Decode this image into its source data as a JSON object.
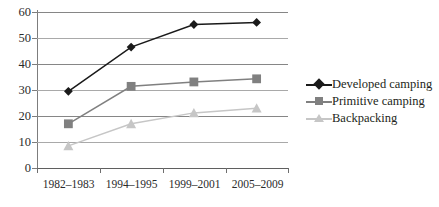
{
  "chart_data": {
    "type": "line",
    "title": "",
    "xlabel": "",
    "ylabel": "",
    "categories": [
      "1982–1983",
      "1994–1995",
      "1999–2001",
      "2005–2009"
    ],
    "series": [
      {
        "name": "Developed camping",
        "marker": "diamond",
        "color": "#1a1a1a",
        "values": [
          29.5,
          46.5,
          55.2,
          56.0
        ]
      },
      {
        "name": "Primitive camping",
        "marker": "square",
        "color": "#808080",
        "values": [
          17.0,
          31.4,
          33.1,
          34.3
        ]
      },
      {
        "name": "Backpacking",
        "marker": "triangle",
        "color": "#c6c6c6",
        "values": [
          8.5,
          17.0,
          21.2,
          23.0
        ]
      }
    ],
    "ylim": [
      0,
      60
    ],
    "yticks": [
      0,
      10,
      20,
      30,
      40,
      50,
      60
    ],
    "ytick_labels": [
      "0",
      "10",
      "20",
      "30",
      "40",
      "50",
      "60"
    ],
    "grid": true,
    "legend_position": "right"
  },
  "colors": {
    "developed": "#1a1a1a",
    "primitive": "#808080",
    "backpacking": "#c6c6c6",
    "gridline": "#868686",
    "axis": "#6e6e6e",
    "text": "#231f20",
    "background": "#ffffff"
  },
  "legend": {
    "items": [
      {
        "label": "Developed camping"
      },
      {
        "label": "Primitive camping"
      },
      {
        "label": "Backpacking"
      }
    ]
  }
}
